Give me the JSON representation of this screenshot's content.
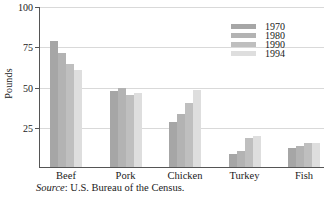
{
  "chart_data": {
    "type": "bar",
    "title": "",
    "xlabel": "",
    "ylabel": "Pounds",
    "ylim": [
      0,
      100
    ],
    "yticks": [
      0,
      25,
      50,
      75,
      100
    ],
    "ytick_labels": [
      "",
      "25",
      "50",
      "75",
      "100"
    ],
    "grid": true,
    "legend_position": "top-right",
    "categories": [
      "Beef",
      "Pork",
      "Chicken",
      "Turkey",
      "Fish"
    ],
    "series": [
      {
        "name": "1970",
        "color": "#a6a6a6",
        "values": [
          78,
          47,
          28,
          8,
          12
        ]
      },
      {
        "name": "1980",
        "color": "#b3b3b3",
        "values": [
          71,
          49,
          33,
          10,
          13
        ]
      },
      {
        "name": "1990",
        "color": "#bfbfbf",
        "values": [
          64,
          45,
          40,
          18,
          15
        ]
      },
      {
        "name": "1994",
        "color": "#dedede",
        "values": [
          60,
          46,
          48,
          19,
          15
        ]
      }
    ],
    "annotations": {
      "source_prefix": "Source",
      "source_text": ": U.S. Bureau of the Census."
    }
  },
  "colors": {
    "axis": "#555555",
    "grid": "#d9d9d9",
    "text": "#1a1a1a",
    "background": "#ffffff"
  }
}
